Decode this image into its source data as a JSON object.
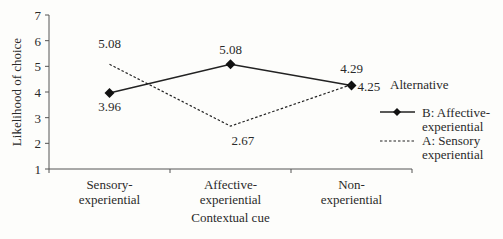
{
  "chart_data": {
    "type": "line",
    "title": "",
    "xlabel": "Contextual cue",
    "ylabel": "Likelihood of choice",
    "ylim": [
      1,
      7
    ],
    "yticks": [
      "1",
      "2",
      "3",
      "4",
      "5",
      "6",
      "7"
    ],
    "categories": [
      "Sensory-experiential",
      "Affective-experiential",
      "Non-experiential"
    ],
    "category_lines": [
      [
        "Sensory-",
        "experiential"
      ],
      [
        "Affective-",
        "experiential"
      ],
      [
        "Non-",
        "experiential"
      ]
    ],
    "legend_title": "Alternative",
    "legend_position": "right",
    "grid": false,
    "series": [
      {
        "name": "B: Affective-experiential",
        "legend_lines": [
          "B: Affective-",
          "experiential"
        ],
        "style": "solid",
        "marker": "diamond",
        "values": [
          3.96,
          5.08,
          4.25
        ],
        "labels": [
          "3.96",
          "5.08",
          "4.25"
        ]
      },
      {
        "name": "A: Sensory experiential",
        "legend_lines": [
          "A: Sensory",
          "experiential"
        ],
        "style": "dashed",
        "marker": "none",
        "values": [
          5.08,
          2.67,
          4.29
        ],
        "labels": [
          "5.08",
          "2.67",
          "4.29"
        ]
      }
    ]
  }
}
